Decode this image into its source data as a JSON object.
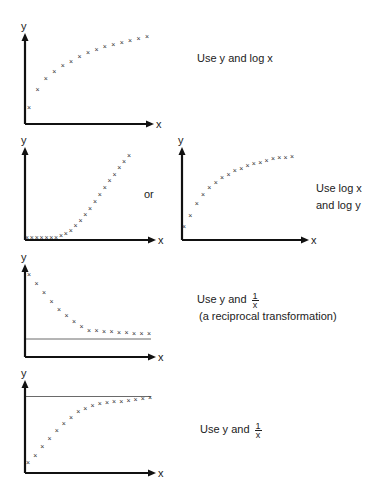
{
  "axis_labels": {
    "x": "x",
    "y": "y"
  },
  "chart_data": [
    {
      "type": "scatter",
      "id": "concave-increasing",
      "title": "",
      "xlabel": "x",
      "ylabel": "y",
      "marker": "×",
      "shape": "increasing, concave (diminishing returns)",
      "x": [
        1,
        2,
        3,
        4,
        5,
        6,
        7,
        8,
        9,
        10,
        11,
        12,
        13,
        14,
        15
      ],
      "y": [
        0.15,
        0.35,
        0.48,
        0.56,
        0.63,
        0.68,
        0.74,
        0.79,
        0.82,
        0.85,
        0.88,
        0.9,
        0.92,
        0.95,
        0.97
      ],
      "recommendation": "Use y and log x"
    },
    {
      "type": "scatter",
      "id": "convex-increasing",
      "xlabel": "x",
      "ylabel": "y",
      "marker": "×",
      "shape": "increasing, convex (exponential-like)",
      "x": [
        1,
        2,
        3,
        4,
        5,
        6,
        7,
        8,
        9,
        10,
        11,
        12,
        13,
        14,
        15,
        16,
        17,
        18,
        19,
        20,
        21,
        22
      ],
      "y": [
        0,
        0,
        0,
        0,
        0,
        0,
        0,
        0.02,
        0.04,
        0.08,
        0.13,
        0.19,
        0.26,
        0.33,
        0.41,
        0.49,
        0.57,
        0.65,
        0.72,
        0.8,
        0.87,
        0.94
      ],
      "recommendation": "Use log x and log y"
    },
    {
      "type": "scatter",
      "id": "concave-increasing-steep",
      "xlabel": "x",
      "ylabel": "y",
      "marker": "×",
      "shape": "increasing, concave (power-like)",
      "x": [
        1,
        2,
        3,
        4,
        5,
        6,
        7,
        8,
        9,
        10,
        11,
        12,
        13,
        14,
        15,
        16,
        17,
        18
      ],
      "y": [
        0.12,
        0.25,
        0.4,
        0.5,
        0.58,
        0.64,
        0.7,
        0.74,
        0.78,
        0.81,
        0.84,
        0.86,
        0.88,
        0.9,
        0.92,
        0.93,
        0.94,
        0.95
      ],
      "recommendation": "Use log x and log y"
    },
    {
      "type": "scatter",
      "id": "decreasing-asymptote",
      "xlabel": "x",
      "ylabel": "y",
      "marker": "×",
      "shape": "decreasing toward horizontal asymptote",
      "asymptote_y": 0.2,
      "x": [
        1,
        2,
        3,
        4,
        5,
        6,
        7,
        8,
        9,
        10,
        11,
        12,
        13,
        14,
        15,
        16,
        17
      ],
      "y": [
        0.92,
        0.82,
        0.72,
        0.62,
        0.53,
        0.46,
        0.39,
        0.34,
        0.3,
        0.29,
        0.28,
        0.28,
        0.27,
        0.27,
        0.26,
        0.26,
        0.26
      ],
      "recommendation": "Use y and 1/x",
      "note": "(a reciprocal transformation)"
    },
    {
      "type": "scatter",
      "id": "increasing-asymptote",
      "xlabel": "x",
      "ylabel": "y",
      "marker": "×",
      "shape": "increasing toward horizontal asymptote",
      "asymptote_y": 0.85,
      "x": [
        1,
        2,
        3,
        4,
        5,
        6,
        7,
        8,
        9,
        10,
        11,
        12,
        13,
        14,
        15,
        16,
        17,
        18
      ],
      "y": [
        0.12,
        0.2,
        0.3,
        0.38,
        0.47,
        0.55,
        0.62,
        0.68,
        0.72,
        0.75,
        0.77,
        0.78,
        0.79,
        0.8,
        0.81,
        0.82,
        0.83,
        0.84
      ],
      "recommendation": "Use y and 1/x"
    }
  ],
  "labels": {
    "row1": {
      "text": "Use y and log x"
    },
    "row2_or": "or",
    "row2": {
      "line1": "Use log x",
      "line2": "and log y"
    },
    "row3": {
      "prefix": "Use y and ",
      "num": "1",
      "den": "x",
      "note": "(a reciprocal transformation)"
    },
    "row4": {
      "prefix": "Use y and ",
      "num": "1",
      "den": "x"
    }
  }
}
